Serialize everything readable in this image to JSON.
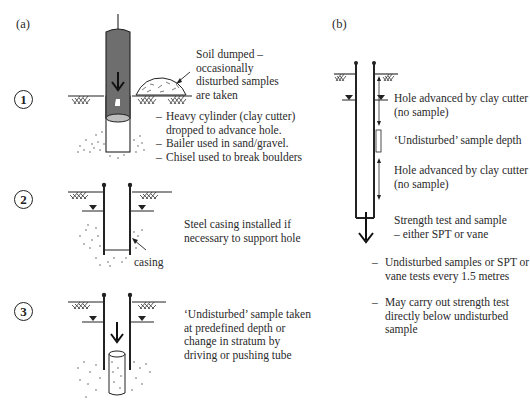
{
  "panel_a": {
    "label": "(a)",
    "steps": [
      {
        "number": "1",
        "callout_lines": [
          "Soil dumped –",
          "occasionally",
          "disturbed samples",
          "are taken"
        ],
        "bullets": [
          "Heavy cylinder (clay cutter)",
          "dropped to advance hole.",
          "Bailer used in sand/gravel.",
          "Chisel used to break boulders"
        ]
      },
      {
        "number": "2",
        "text_lines": [
          "Steel casing installed if",
          "necessary to support hole"
        ],
        "casing_label": "casing"
      },
      {
        "number": "3",
        "text_lines": [
          "‘Undisturbed’ sample taken",
          "at predefined depth or",
          "change in stratum by",
          "driving or pushing tube"
        ]
      }
    ]
  },
  "panel_b": {
    "label": "(b)",
    "annotations": [
      {
        "lines": [
          "Hole advanced by clay cutter",
          "(no sample)"
        ]
      },
      {
        "lines": [
          "‘Undisturbed’ sample depth"
        ]
      },
      {
        "lines": [
          "Hole advanced by clay cutter",
          "(no sample)"
        ]
      },
      {
        "lines": [
          "Strength test and sample",
          "– either SPT or vane"
        ]
      }
    ],
    "bullets": [
      {
        "lines": [
          "Undisturbed samples or SPT or",
          "vane tests every 1.5 metres"
        ]
      },
      {
        "lines": [
          "May carry out strength test",
          "directly below undisturbed",
          "sample"
        ]
      }
    ],
    "dash": "–"
  },
  "colors": {
    "cylinder_fill": "#6e6e6e",
    "line": "#222222",
    "background": "#ffffff"
  }
}
